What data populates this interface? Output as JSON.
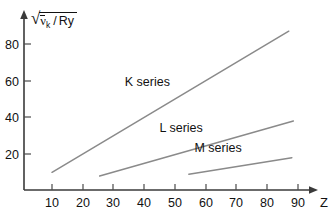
{
  "chart_data": {
    "type": "line",
    "title": "",
    "xlabel": "Z",
    "ylabel": "sqrt( nu_k_bar / Ry )",
    "xlim": [
      0,
      95
    ],
    "ylim": [
      0,
      92
    ],
    "xticks": [
      10,
      20,
      30,
      40,
      50,
      60,
      70,
      80,
      90
    ],
    "yticks": [
      20,
      40,
      60,
      80
    ],
    "grid": false,
    "legend": "inline-labels",
    "series": [
      {
        "name": "K series",
        "label": "K series",
        "label_x": 41,
        "label_y": 57,
        "x": [
          10,
          87
        ],
        "y": [
          10,
          87
        ],
        "color": "#8a8a8a"
      },
      {
        "name": "L series",
        "label": "L series",
        "label_x": 52,
        "label_y": 32,
        "x": [
          25.5,
          88.5
        ],
        "y": [
          8,
          38
        ],
        "color": "#8a8a8a"
      },
      {
        "name": "M series",
        "label": "M series",
        "label_x": 64,
        "label_y": 21,
        "x": [
          54.5,
          88
        ],
        "y": [
          9,
          18
        ],
        "color": "#8a8a8a"
      }
    ]
  },
  "ylabel_parts": {
    "radical": "√",
    "nu": "ν",
    "nu_subscript": "k",
    "slash": "/",
    "ry": "Ry"
  },
  "xaxis_name": "Z",
  "tick_labels": {
    "x": [
      "10",
      "20",
      "30",
      "40",
      "50",
      "60",
      "70",
      "80",
      "90"
    ],
    "y": [
      "20",
      "40",
      "60",
      "80"
    ]
  },
  "colors": {
    "axis": "#3a3a3a",
    "series": "#8a8a8a",
    "text": "#111111",
    "background": "#ffffff"
  }
}
